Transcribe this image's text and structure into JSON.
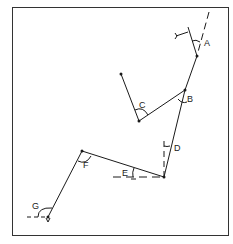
{
  "diagram": {
    "type": "traverse-angles",
    "labels": {
      "A": "A",
      "B": "B",
      "C": "C",
      "D": "D",
      "E": "E",
      "F": "F",
      "G": "G"
    },
    "colors": {
      "line": "#1a1a1a",
      "frame": "#333333",
      "background": "#ffffff"
    }
  }
}
